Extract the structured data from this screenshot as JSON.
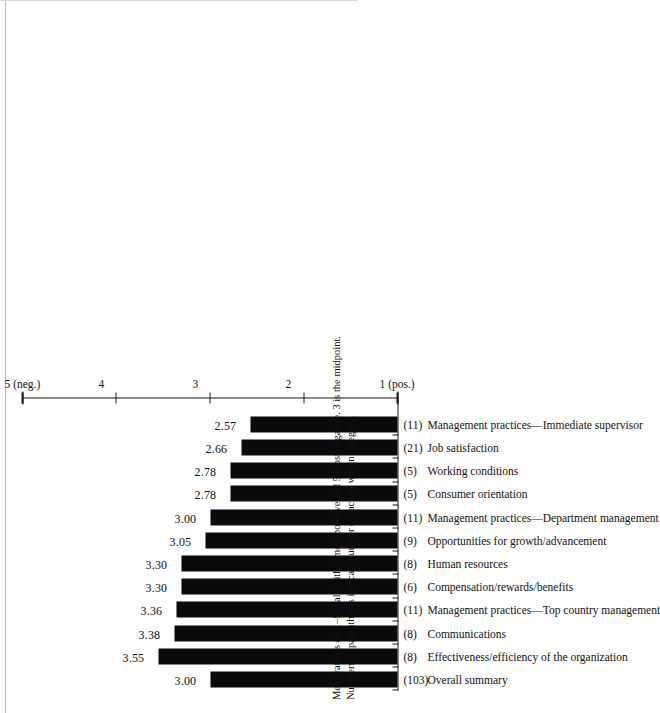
{
  "chart_data": {
    "type": "bar",
    "orientation": "vertical-rotated-90ccw",
    "title": "",
    "xlabel": "",
    "ylabel": "",
    "ylim": [
      1,
      5
    ],
    "yticks": [
      1,
      2,
      3,
      4,
      5
    ],
    "ytick_labels": [
      "1 (pos.)",
      "2",
      "3",
      "4",
      "5 (neg.)"
    ],
    "grid": false,
    "legend": null,
    "bar_color": "#0a0a0a",
    "categories": [
      "Overall summary",
      "Effectiveness/efficiency of the organization",
      "Communications",
      "Management practices—Top country management",
      "Compensation/rewards/benefits",
      "Human resources",
      "Opportunities for growth/advancement",
      "Management practices—Department management",
      "Consumer orientation",
      "Working conditions",
      "Job satisfaction",
      "Management practices—Immediate supervisor"
    ],
    "counts": [
      "(103)",
      "(8)",
      "(8)",
      "(11)",
      "(6)",
      "(8)",
      "(9)",
      "(11)",
      "(5)",
      "(5)",
      "(21)",
      "(11)"
    ],
    "values": [
      3.0,
      3.55,
      3.38,
      3.36,
      3.3,
      3.3,
      3.05,
      3.0,
      2.78,
      2.78,
      2.66,
      2.57
    ],
    "value_labels": [
      "3.00",
      "3.55",
      "3.38",
      "3.36",
      "3.30",
      "3.30",
      "3.05",
      "3.00",
      "2.78",
      "2.78",
      "2.66",
      "2.57"
    ]
  },
  "footnote": {
    "line1": "Mean ratings on 1–5 scale with 1 most positive and 5 most negative. 3 is the midpoint.",
    "line2": "Numbers in parentheses indicate number of factors within category."
  }
}
